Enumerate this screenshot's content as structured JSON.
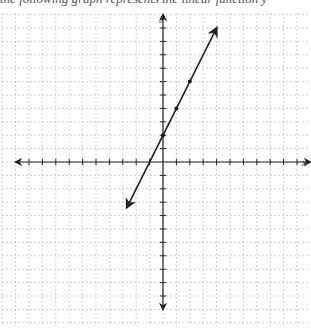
{
  "header": {
    "cutoff_text": "the following graph represents the linear function y"
  },
  "chart_data": {
    "type": "line",
    "title": "",
    "xlabel": "x",
    "ylabel": "y",
    "xlim": [
      -10,
      10
    ],
    "ylim": [
      -10,
      10
    ],
    "grid": true,
    "grid_style": "dashed",
    "tick_step": 1,
    "series": [
      {
        "name": "y = 2x + 2",
        "equation": "y = 2x + 2",
        "slope": 2,
        "intercept": 2,
        "points": [
          [
            0,
            2
          ],
          [
            1,
            4
          ],
          [
            2,
            6
          ]
        ],
        "line_from": [
          -2.7,
          -3.4
        ],
        "line_to": [
          4,
          10
        ],
        "arrows_both_ends": true
      }
    ]
  },
  "colors": {
    "axis": "#222222",
    "grid": "#b8b8b8",
    "line": "#1a1a1a"
  }
}
